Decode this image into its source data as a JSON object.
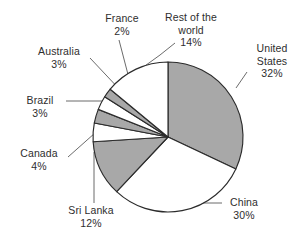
{
  "chart_data": {
    "type": "pie",
    "title": "",
    "subtitle": "",
    "xlabel": "",
    "ylabel": "",
    "legend_position": "none",
    "grid": false,
    "label_format": "name + percent",
    "start_angle_deg": 0,
    "direction": "clockwise",
    "categories": [
      "United States",
      "China",
      "Sri Lanka",
      "Canada",
      "Brazil",
      "Australia",
      "France",
      "Rest of the world"
    ],
    "values": [
      32,
      30,
      12,
      4,
      3,
      3,
      2,
      14
    ],
    "units": "%",
    "slices": [
      {
        "label": "United States",
        "value": 32,
        "value_text": "32%",
        "fill": "#a8a8a8"
      },
      {
        "label": "China",
        "value": 30,
        "value_text": "30%",
        "fill": "#ffffff"
      },
      {
        "label": "Sri Lanka",
        "value": 12,
        "value_text": "12%",
        "fill": "#a8a8a8"
      },
      {
        "label": "Canada",
        "value": 4,
        "value_text": "4%",
        "fill": "#ffffff"
      },
      {
        "label": "Brazil",
        "value": 3,
        "value_text": "3%",
        "fill": "#a8a8a8"
      },
      {
        "label": "Australia",
        "value": 3,
        "value_text": "3%",
        "fill": "#ffffff"
      },
      {
        "label": "France",
        "value": 2,
        "value_text": "2%",
        "fill": "#a8a8a8"
      },
      {
        "label": "Rest of the world",
        "value": 14,
        "value_text": "14%",
        "fill": "#ffffff"
      }
    ]
  },
  "labels": {
    "france": {
      "name": "France",
      "value": "2%"
    },
    "rest": {
      "name": "Rest of the",
      "name2": "world",
      "value": "14%"
    },
    "united": {
      "name": "United",
      "name2": "States",
      "value": "32%"
    },
    "australia": {
      "name": "Australia",
      "value": "3%"
    },
    "brazil": {
      "name": "Brazil",
      "value": "3%"
    },
    "canada": {
      "name": "Canada",
      "value": "4%"
    },
    "srilanka": {
      "name": "Sri Lanka",
      "value": "12%"
    },
    "china": {
      "name": "China",
      "value": "30%"
    }
  },
  "colors": {
    "slice_gray": "#a8a8a8",
    "slice_white": "#ffffff",
    "outline": "#2b2b2b",
    "leader": "#5a5a5a",
    "text": "#2e2e2e",
    "background": "#ffffff"
  }
}
